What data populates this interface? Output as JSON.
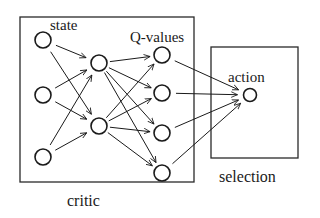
{
  "labels": {
    "state": "state",
    "q_values": "Q-values",
    "action": "action",
    "critic": "critic",
    "selection": "selection"
  },
  "boxes": {
    "critic": {
      "x": 20,
      "y": 17,
      "w": 174,
      "h": 165
    },
    "selection": {
      "x": 211,
      "y": 47,
      "w": 87,
      "h": 111
    }
  },
  "nodes": {
    "inputs": [
      {
        "x": 43,
        "y": 40
      },
      {
        "x": 43,
        "y": 95
      },
      {
        "x": 43,
        "y": 157
      }
    ],
    "hidden": [
      {
        "x": 99,
        "y": 63
      },
      {
        "x": 99,
        "y": 126
      }
    ],
    "q_values": [
      {
        "x": 162,
        "y": 55
      },
      {
        "x": 162,
        "y": 93
      },
      {
        "x": 162,
        "y": 133
      },
      {
        "x": 162,
        "y": 173
      }
    ],
    "action": {
      "x": 250,
      "y": 95
    }
  },
  "node_radius": 8,
  "action_radius": 6.5,
  "colors": {
    "stroke": "#1a1a1a",
    "background": "#ffffff"
  }
}
